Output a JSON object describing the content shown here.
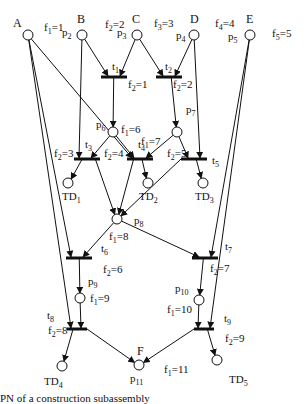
{
  "diagram": {
    "caption": "PN of a construction subassembly",
    "places": [
      {
        "id": "A",
        "label": "A",
        "sublabel": ""
      },
      {
        "id": "B",
        "label": "B",
        "sublabel": "p2"
      },
      {
        "id": "C",
        "label": "C",
        "sublabel": "p3"
      },
      {
        "id": "D",
        "label": "D",
        "sublabel": "p4"
      },
      {
        "id": "E",
        "label": "E",
        "sublabel": "p5"
      },
      {
        "id": "p6",
        "label": "p6"
      },
      {
        "id": "p7",
        "label": "p7"
      },
      {
        "id": "TD1",
        "label": "TD1"
      },
      {
        "id": "TD2",
        "label": "TD2"
      },
      {
        "id": "TD3",
        "label": "TD3"
      },
      {
        "id": "p8",
        "label": "p8"
      },
      {
        "id": "p9",
        "label": "p9"
      },
      {
        "id": "p10",
        "label": "p10"
      },
      {
        "id": "TD4",
        "label": "TD4"
      },
      {
        "id": "TD5",
        "label": "TD5"
      },
      {
        "id": "p11",
        "label": "p11",
        "top_label": "F"
      }
    ],
    "transitions": [
      "t1",
      "t2",
      "t3",
      "t4",
      "t5",
      "t6",
      "t7",
      "t8",
      "t9"
    ],
    "function_labels": {
      "B": "f1=1",
      "C": "f2=2",
      "D": "f3=3",
      "E_left": "f4=4",
      "E_right": "f5=5",
      "t1": "f2=1",
      "t2": "f2=2",
      "p6": "f1=6",
      "p7": "f1=7",
      "t3": "f2=3",
      "t4": "f2=4",
      "t5": "f2=5",
      "p8": "f1=8",
      "t6": "f2=6",
      "t7": "f2=7",
      "p9": "f1=9",
      "p10": "f1=10",
      "t8": "f2=8",
      "t9": "f2=9",
      "p11": "f1=11"
    },
    "arcs": [
      [
        "B",
        "t1"
      ],
      [
        "C",
        "t1"
      ],
      [
        "C",
        "t2"
      ],
      [
        "D",
        "t2"
      ],
      [
        "t1",
        "p6"
      ],
      [
        "t2",
        "p7"
      ],
      [
        "B",
        "t3"
      ],
      [
        "p6",
        "t3"
      ],
      [
        "A",
        "t4"
      ],
      [
        "p6",
        "t4"
      ],
      [
        "p7",
        "t4"
      ],
      [
        "p7",
        "t5"
      ],
      [
        "D",
        "t5"
      ],
      [
        "t3",
        "TD1"
      ],
      [
        "t4",
        "TD2"
      ],
      [
        "t5",
        "TD3"
      ],
      [
        "t3",
        "p8"
      ],
      [
        "t4",
        "p8"
      ],
      [
        "t5",
        "p8"
      ],
      [
        "A",
        "t6"
      ],
      [
        "p8",
        "t6"
      ],
      [
        "p8",
        "t7"
      ],
      [
        "E",
        "t7"
      ],
      [
        "t6",
        "p9"
      ],
      [
        "t7",
        "p10"
      ],
      [
        "A",
        "t8"
      ],
      [
        "p9",
        "t8"
      ],
      [
        "p10",
        "t9"
      ],
      [
        "E",
        "t9"
      ],
      [
        "t8",
        "TD4"
      ],
      [
        "t8",
        "p11"
      ],
      [
        "t9",
        "p11"
      ],
      [
        "t9",
        "TD5"
      ]
    ]
  }
}
